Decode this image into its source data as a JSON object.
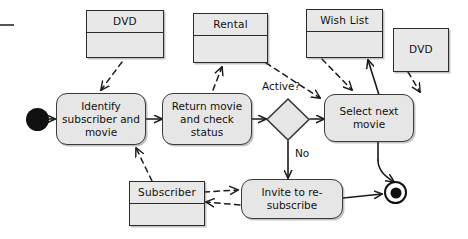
{
  "diagram": {
    "type": "uml-activity-diagram",
    "colors": {
      "node_fill": "#e6e6e6",
      "object_fill": "#e8e8e8",
      "stroke": "#2b2b2b",
      "background": "#ffffff"
    }
  },
  "object_nodes": [
    {
      "id": "dvd_left",
      "label": "DVD"
    },
    {
      "id": "rental",
      "label": "Rental"
    },
    {
      "id": "wishlist",
      "label": "Wish List"
    },
    {
      "id": "dvd_right",
      "label": "DVD"
    },
    {
      "id": "subscriber",
      "label": "Subscriber"
    }
  ],
  "action_nodes": [
    {
      "id": "identify",
      "label": "Identify subscriber and movie"
    },
    {
      "id": "return",
      "label": "Return movie and check status"
    },
    {
      "id": "select",
      "label": "Select next movie"
    },
    {
      "id": "invite",
      "label": "Invite to re-subscribe"
    }
  ],
  "decision_nodes": [
    {
      "id": "active",
      "label": "Active?"
    }
  ],
  "control_nodes": [
    {
      "id": "initial",
      "label": "initial-node"
    },
    {
      "id": "final",
      "label": "activity-final-node"
    }
  ],
  "edge_labels": [
    {
      "id": "active_label",
      "text": "Active?"
    },
    {
      "id": "no_label",
      "text": "No"
    }
  ]
}
